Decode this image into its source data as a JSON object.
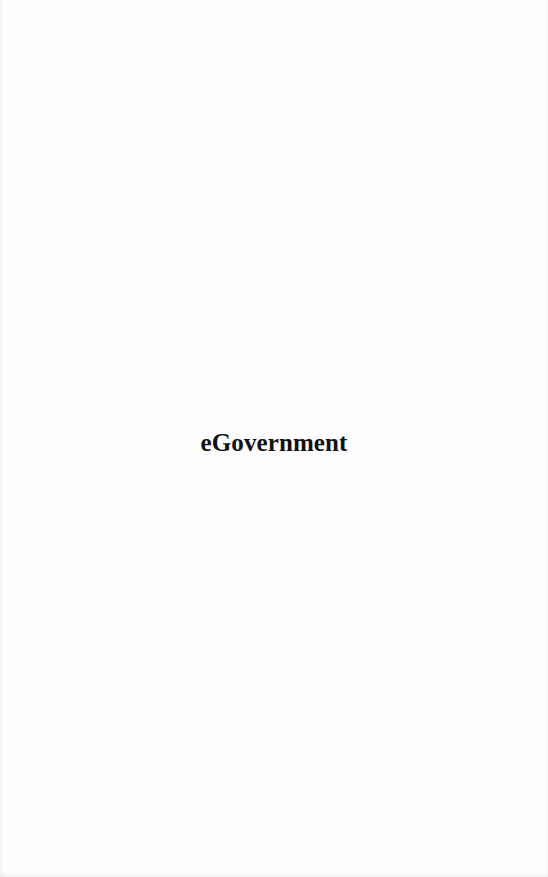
{
  "page": {
    "title": "eGovernment"
  }
}
